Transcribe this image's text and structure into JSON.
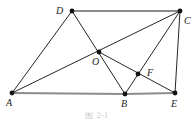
{
  "figure": {
    "kind": "plane-geometry-diagram",
    "caption": "图 2-1",
    "background_color": "#ffffff",
    "stroke_color": "#1a1a1a",
    "thick_stroke_color": "#8c8c8c",
    "vertex_color": "#111111"
  },
  "points": [
    {
      "id": "A",
      "label": "A",
      "x": 12,
      "y": 93,
      "label_x": 6,
      "label_y": 98
    },
    {
      "id": "B",
      "label": "B",
      "x": 125,
      "y": 94,
      "label_x": 121,
      "label_y": 99
    },
    {
      "id": "C",
      "label": "C",
      "x": 180,
      "y": 11,
      "label_x": 184,
      "label_y": 16
    },
    {
      "id": "D",
      "label": "D",
      "x": 72,
      "y": 11,
      "label_x": 56,
      "label_y": 6
    },
    {
      "id": "E",
      "label": "E",
      "x": 175,
      "y": 93,
      "label_x": 171,
      "label_y": 99
    },
    {
      "id": "F",
      "label": "F",
      "x": 138,
      "y": 74,
      "label_x": 147,
      "label_y": 68
    },
    {
      "id": "O",
      "label": "O",
      "x": 99,
      "y": 52,
      "label_x": 92,
      "label_y": 57
    }
  ],
  "segments": [
    {
      "id": "AB",
      "from": "A",
      "to": "B",
      "weight": "thick"
    },
    {
      "id": "BE",
      "from": "B",
      "to": "E",
      "weight": "thick"
    },
    {
      "id": "DC",
      "from": "D",
      "to": "C",
      "weight": "thick"
    },
    {
      "id": "AD",
      "from": "A",
      "to": "D",
      "weight": "thin"
    },
    {
      "id": "AC",
      "from": "A",
      "to": "C",
      "weight": "thin"
    },
    {
      "id": "DB",
      "from": "D",
      "to": "B",
      "weight": "thin"
    },
    {
      "id": "CB",
      "from": "C",
      "to": "B",
      "weight": "thin"
    },
    {
      "id": "CE",
      "from": "C",
      "to": "E",
      "weight": "thin"
    },
    {
      "id": "OE",
      "from": "O",
      "to": "E",
      "weight": "thin"
    }
  ],
  "vertex_dot_radius": 2.4
}
